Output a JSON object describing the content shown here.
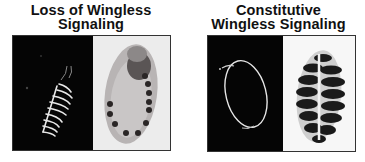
{
  "figures": [
    {
      "caption_line1": "Loss of Wingless",
      "caption_line2": "Signaling",
      "panels": [
        {
          "type": "fluorescence",
          "description": "dark-field embryo with bright stripes"
        },
        {
          "type": "brightfield",
          "description": "embryo with dark spot segment markers"
        }
      ]
    },
    {
      "caption_line1": "Constitutive",
      "caption_line2": "Wingless Signaling",
      "panels": [
        {
          "type": "fluorescence",
          "description": "dark-field embryo outline"
        },
        {
          "type": "brightfield",
          "description": "embryo with thick dark bands"
        }
      ]
    }
  ],
  "colors": {
    "background": "#ffffff",
    "dark_panel": "#050505",
    "light_panel": "#ececec"
  }
}
